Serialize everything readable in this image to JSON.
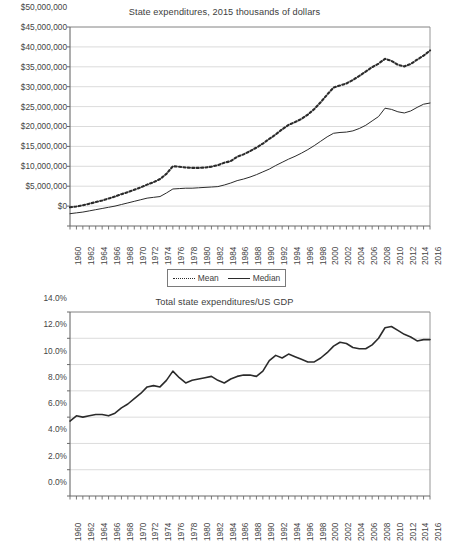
{
  "charts": [
    {
      "title": "State expenditures, 2015 thousands of dollars",
      "legend": {
        "mean_label": "Mean",
        "median_label": "Median"
      }
    },
    {
      "title": "Total state expenditures/US GDP"
    }
  ],
  "chart_data": [
    {
      "type": "line",
      "title": "State expenditures, 2015 thousands of dollars",
      "xlabel": "",
      "ylabel": "",
      "xlim": [
        1960,
        2016
      ],
      "ylim": [
        0,
        50000000
      ],
      "grid": true,
      "legend_position": "bottom",
      "x": [
        1960,
        1961,
        1962,
        1963,
        1964,
        1965,
        1966,
        1967,
        1968,
        1969,
        1970,
        1971,
        1972,
        1973,
        1974,
        1975,
        1976,
        1977,
        1978,
        1979,
        1980,
        1981,
        1982,
        1983,
        1984,
        1985,
        1986,
        1987,
        1988,
        1989,
        1990,
        1991,
        1992,
        1993,
        1994,
        1995,
        1996,
        1997,
        1998,
        1999,
        2000,
        2001,
        2002,
        2003,
        2004,
        2005,
        2006,
        2007,
        2008,
        2009,
        2010,
        2011,
        2012,
        2013,
        2014,
        2015,
        2016
      ],
      "xticklabels": [
        "1960",
        "1962",
        "1964",
        "1966",
        "1968",
        "1970",
        "1972",
        "1974",
        "1976",
        "1978",
        "1980",
        "1982",
        "1984",
        "1986",
        "1988",
        "1990",
        "1992",
        "1994",
        "1996",
        "1998",
        "2000",
        "2002",
        "2004",
        "2006",
        "2008",
        "2010",
        "2012",
        "2014",
        "2016"
      ],
      "yticklabels": [
        "$0",
        "$5,000,000",
        "$10,000,000",
        "$15,000,000",
        "$20,000,000",
        "$25,000,000",
        "$30,000,000",
        "$35,000,000",
        "$40,000,000",
        "$45,000,000",
        "$50,000,000"
      ],
      "ytickvalues": [
        0,
        5000000,
        10000000,
        15000000,
        20000000,
        25000000,
        30000000,
        35000000,
        40000000,
        45000000,
        50000000
      ],
      "series": [
        {
          "name": "Mean",
          "style": "dotted",
          "color": "#2b2b2b",
          "values": [
            4700000,
            4900000,
            5200000,
            5600000,
            6000000,
            6400000,
            6900000,
            7400000,
            8000000,
            8500000,
            9100000,
            9700000,
            10400000,
            11000000,
            11800000,
            13100000,
            15000000,
            14900000,
            14700000,
            14600000,
            14600000,
            14700000,
            14900000,
            15300000,
            15900000,
            16300000,
            17400000,
            18000000,
            18800000,
            19700000,
            20700000,
            21900000,
            23000000,
            24300000,
            25400000,
            26100000,
            26900000,
            28000000,
            29400000,
            31100000,
            33000000,
            34800000,
            35300000,
            35800000,
            36700000,
            37700000,
            38800000,
            39900000,
            40800000,
            42000000,
            41500000,
            40500000,
            40100000,
            40700000,
            41800000,
            42800000,
            44100000
          ]
        },
        {
          "name": "Median",
          "style": "solid",
          "color": "#2b2b2b",
          "values": [
            3100000,
            3300000,
            3500000,
            3800000,
            4100000,
            4400000,
            4700000,
            5000000,
            5400000,
            5800000,
            6200000,
            6600000,
            7000000,
            7200000,
            7400000,
            8300000,
            9300000,
            9400000,
            9500000,
            9500000,
            9600000,
            9700000,
            9800000,
            9900000,
            10300000,
            10800000,
            11400000,
            11800000,
            12300000,
            12900000,
            13600000,
            14300000,
            15200000,
            16000000,
            16800000,
            17500000,
            18300000,
            19200000,
            20200000,
            21300000,
            22400000,
            23300000,
            23500000,
            23600000,
            23900000,
            24500000,
            25300000,
            26400000,
            27500000,
            29600000,
            29300000,
            28700000,
            28400000,
            28900000,
            29800000,
            30600000,
            30900000
          ]
        }
      ]
    },
    {
      "type": "line",
      "title": "Total state expenditures/US GDP",
      "xlabel": "",
      "ylabel": "",
      "xlim": [
        1960,
        2016
      ],
      "ylim": [
        0,
        14
      ],
      "grid": true,
      "legend_position": "none",
      "x": [
        1960,
        1961,
        1962,
        1963,
        1964,
        1965,
        1966,
        1967,
        1968,
        1969,
        1970,
        1971,
        1972,
        1973,
        1974,
        1975,
        1976,
        1977,
        1978,
        1979,
        1980,
        1981,
        1982,
        1983,
        1984,
        1985,
        1986,
        1987,
        1988,
        1989,
        1990,
        1991,
        1992,
        1993,
        1994,
        1995,
        1996,
        1997,
        1998,
        1999,
        2000,
        2001,
        2002,
        2003,
        2004,
        2005,
        2006,
        2007,
        2008,
        2009,
        2010,
        2011,
        2012,
        2013,
        2014,
        2015,
        2016
      ],
      "xticklabels": [
        "1960",
        "1962",
        "1964",
        "1966",
        "1968",
        "1970",
        "1972",
        "1974",
        "1976",
        "1978",
        "1980",
        "1982",
        "1984",
        "1986",
        "1988",
        "1990",
        "1992",
        "1994",
        "1996",
        "1998",
        "2000",
        "2002",
        "2004",
        "2006",
        "2008",
        "2010",
        "2012",
        "2014",
        "2016"
      ],
      "yticklabels": [
        "0.0%",
        "2.0%",
        "4.0%",
        "6.0%",
        "8.0%",
        "10.0%",
        "12.0%",
        "14.0%"
      ],
      "ytickvalues": [
        0,
        2,
        4,
        6,
        8,
        10,
        12,
        14
      ],
      "series": [
        {
          "name": "Total state expenditures/US GDP",
          "style": "solid",
          "color": "#2b2b2b",
          "values": [
            5.7,
            6.1,
            6.0,
            6.1,
            6.2,
            6.2,
            6.1,
            6.3,
            6.7,
            7.0,
            7.4,
            7.8,
            8.3,
            8.4,
            8.3,
            8.8,
            9.5,
            9.0,
            8.6,
            8.8,
            8.9,
            9.0,
            9.1,
            8.8,
            8.6,
            8.9,
            9.1,
            9.2,
            9.2,
            9.1,
            9.5,
            10.3,
            10.7,
            10.5,
            10.8,
            10.6,
            10.4,
            10.2,
            10.2,
            10.5,
            10.9,
            11.4,
            11.7,
            11.6,
            11.3,
            11.2,
            11.2,
            11.5,
            12.0,
            12.8,
            12.9,
            12.6,
            12.3,
            12.1,
            11.8,
            11.9,
            11.9
          ]
        }
      ]
    }
  ]
}
